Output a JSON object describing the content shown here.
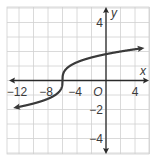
{
  "chart_data": {
    "type": "line",
    "title": "",
    "xlabel": "x",
    "ylabel": "y",
    "function": "y = cbrt(x + 6)",
    "xlim": [
      -13,
      5.5
    ],
    "ylim": [
      -5,
      5
    ],
    "grid": true,
    "grid_x_step": 2,
    "grid_y_step": 1,
    "x_tick_labels": [
      "-12",
      "-8",
      "-4",
      "4"
    ],
    "x_ticks": [
      -12,
      -8,
      -4,
      4
    ],
    "y_tick_labels": [
      "4",
      "-2",
      "-4"
    ],
    "y_ticks": [
      4,
      -2,
      -4
    ],
    "origin_label": "O",
    "series": [
      {
        "name": "curve",
        "x": [
          -12.5,
          -12,
          -10,
          -8,
          -7,
          -6.5,
          -6,
          -5.5,
          -5,
          -4,
          -2,
          0,
          2,
          4,
          5
        ],
        "y": [
          -1.87,
          -1.82,
          -1.59,
          -1.26,
          -1.0,
          -0.79,
          0.0,
          0.79,
          1.0,
          1.26,
          1.59,
          1.82,
          2.0,
          2.15,
          2.22
        ]
      }
    ],
    "colors": {
      "curve": "#3a3a3a",
      "grid": "#d0d0d0",
      "axis": "#2a2a2a"
    }
  }
}
